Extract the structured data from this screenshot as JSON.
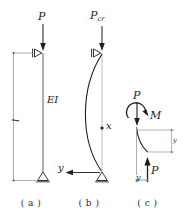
{
  "figure": {
    "stroke_color": "#1d1d1d",
    "light_stroke_color": "#9a9a9a",
    "background_color": "#ffffff"
  },
  "panels": [
    {
      "id": "a",
      "caption": "( a )",
      "description": "Straight pin-ended column under axial load",
      "labels": {
        "load": "P",
        "length": "l",
        "rigidity": "EI"
      },
      "supports": {
        "top": "roller-support-horizontal",
        "bottom": "pin-support"
      }
    },
    {
      "id": "b",
      "caption": "( b )",
      "description": "Buckled column shape at critical load",
      "labels": {
        "load_symbol": "P",
        "load_subscript": "cr",
        "axis_x": "x",
        "axis_y": "y"
      },
      "supports": {
        "top": "roller-support-horizontal",
        "bottom": "pin-support"
      }
    },
    {
      "id": "c",
      "caption": "( c )",
      "description": "Free-body diagram of column segment",
      "labels": {
        "top_force": "P",
        "moment": "M",
        "deflection": "y",
        "bottom_force": "P",
        "bottom_coordinate": "y"
      }
    }
  ]
}
